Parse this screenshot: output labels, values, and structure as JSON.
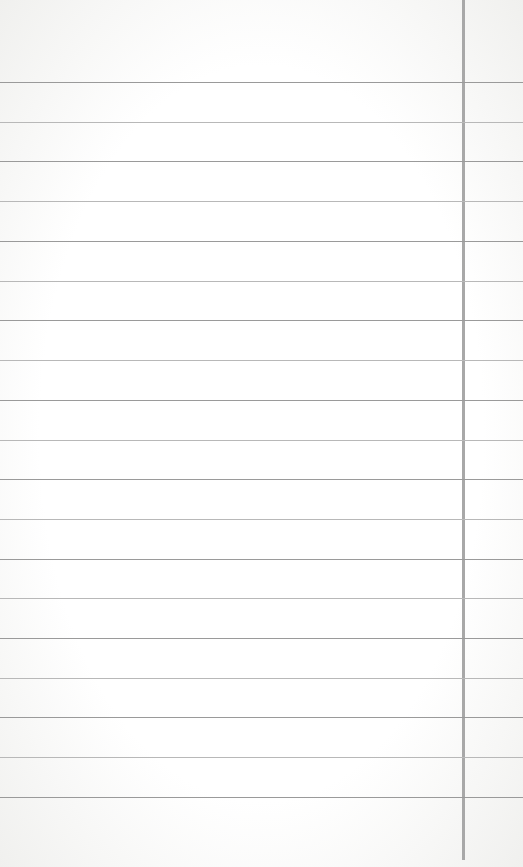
{
  "paper": {
    "type": "lined-notepad",
    "line_color": "#9a9a9a",
    "margin_line_color": "#a8a8a8",
    "background": "#ffffff",
    "margin_x": 463,
    "line_positions": [
      82,
      122,
      161,
      201,
      241,
      281,
      320,
      360,
      400,
      440,
      479,
      519,
      559,
      598,
      638,
      678,
      717,
      757,
      797
    ]
  }
}
